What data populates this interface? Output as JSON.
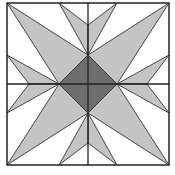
{
  "diagram": {
    "colors": {
      "background": "#ffffff",
      "light": "#c4c4c4",
      "dark": "#6e6e6e",
      "stroke": "#333333"
    },
    "frame": {
      "x": 7,
      "y": 3,
      "size": 162
    },
    "center_diamond_radius": 29,
    "spoke_depth": 22
  }
}
